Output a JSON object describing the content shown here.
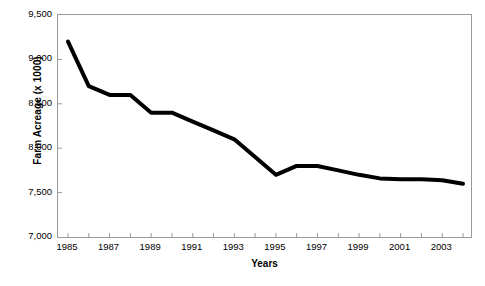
{
  "chart_data": {
    "type": "line",
    "title": "",
    "xlabel": "Years",
    "ylabel": "Farm Acreage (x 1000)",
    "xlim": [
      1985,
      2004
    ],
    "ylim": [
      7000,
      9500
    ],
    "yticks": [
      "9,500",
      "9,000",
      "8,500",
      "8,000",
      "7,500",
      "7,000"
    ],
    "ytick_values": [
      9500,
      9000,
      8500,
      8000,
      7500,
      7000
    ],
    "xticks": [
      "1985",
      "1987",
      "1989",
      "1991",
      "1993",
      "1995",
      "1997",
      "1999",
      "2001",
      "2003"
    ],
    "xtick_values": [
      1985,
      1987,
      1989,
      1991,
      1993,
      1995,
      1997,
      1999,
      2001,
      2003
    ],
    "grid": false,
    "legend": false,
    "line_color": "#000000",
    "line_width": 4,
    "frame_color": "#9a9a9a",
    "x": [
      1985,
      1986,
      1987,
      1988,
      1989,
      1990,
      1991,
      1992,
      1993,
      1994,
      1995,
      1996,
      1997,
      1998,
      1999,
      2000,
      2001,
      2002,
      2003,
      2004
    ],
    "values": [
      9200,
      8700,
      8600,
      8600,
      8400,
      8400,
      8300,
      8200,
      8100,
      7900,
      7700,
      7800,
      7800,
      7750,
      7700,
      7660,
      7650,
      7650,
      7640,
      7600
    ],
    "series": [
      {
        "name": "Farm Acreage",
        "values": [
          9200,
          8700,
          8600,
          8600,
          8400,
          8400,
          8300,
          8200,
          8100,
          7900,
          7700,
          7800,
          7800,
          7750,
          7700,
          7660,
          7650,
          7650,
          7640,
          7600
        ]
      }
    ]
  },
  "caption": {
    "text": ""
  }
}
